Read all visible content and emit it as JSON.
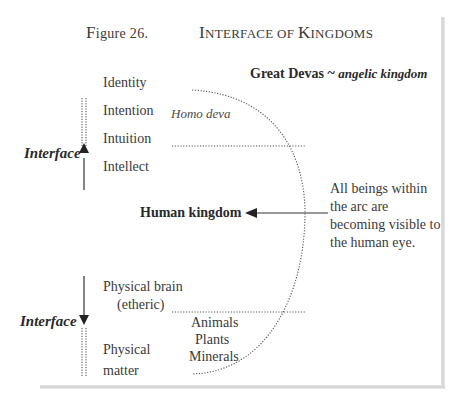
{
  "figure": {
    "number_prefix": "F",
    "number_rest": "igure 26.",
    "title_parts": [
      {
        "big": "I",
        "small": "nterface of "
      },
      {
        "big": "K",
        "small": "ingdoms"
      }
    ]
  },
  "top_right": {
    "bold": "Great Devas ~ ",
    "italic": "angelic kingdom"
  },
  "upper_levels": [
    "Identity",
    "Intention",
    "Intuition",
    "Intellect"
  ],
  "homo_deva": "Homo deva",
  "interface_upper": "Interface",
  "interface_lower": "Interface",
  "human_kingdom": "Human kingdom",
  "annotation": [
    "All beings within",
    "the arc are",
    "becoming visible to",
    "the human eye."
  ],
  "lower_levels": {
    "brain_line1": "Physical brain",
    "brain_line2": "(etheric)",
    "matter_line1": "Physical",
    "matter_line2": "matter"
  },
  "lower_kingdoms": [
    "Animals",
    "Plants",
    "Minerals"
  ],
  "colors": {
    "ink": "#2a2a2a",
    "dots": "#555555",
    "frame": "#d6d6d6"
  }
}
